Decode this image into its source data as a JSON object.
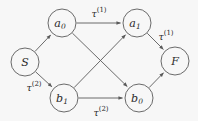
{
  "figure": {
    "kind": "directed-graph",
    "background_color": "#f7f7f7",
    "stroke_color": "#5a5a5a",
    "text_color": "#2b2b2b"
  },
  "nodes": [
    {
      "id": "S",
      "label": "S",
      "sub": "",
      "cx": 25,
      "cy": 62,
      "r": 14
    },
    {
      "id": "a0",
      "label": "a",
      "sub": "0",
      "cx": 62,
      "cy": 23,
      "r": 14
    },
    {
      "id": "a1",
      "label": "a",
      "sub": "1",
      "cx": 137,
      "cy": 23,
      "r": 14
    },
    {
      "id": "b1",
      "label": "b",
      "sub": "1",
      "cx": 64,
      "cy": 98,
      "r": 14
    },
    {
      "id": "b0",
      "label": "b",
      "sub": "0",
      "cx": 139,
      "cy": 98,
      "r": 14
    },
    {
      "id": "F",
      "label": "F",
      "sub": "",
      "cx": 175,
      "cy": 61,
      "r": 14
    }
  ],
  "edges": [
    {
      "id": "S-a0",
      "from": "S",
      "to": "a0",
      "label": "",
      "sup": ""
    },
    {
      "id": "S-b1",
      "from": "S",
      "to": "b1",
      "label": "τ",
      "sup": "(2)"
    },
    {
      "id": "a0-a1",
      "from": "a0",
      "to": "a1",
      "label": "τ",
      "sup": "(1)"
    },
    {
      "id": "a0-b0",
      "from": "a0",
      "to": "b0",
      "label": "",
      "sup": ""
    },
    {
      "id": "b1-a1",
      "from": "b1",
      "to": "a1",
      "label": "",
      "sup": ""
    },
    {
      "id": "b1-b0",
      "from": "b1",
      "to": "b0",
      "label": "τ",
      "sup": "(2)"
    },
    {
      "id": "a1-F",
      "from": "a1",
      "to": "F",
      "label": "τ",
      "sup": "(1)"
    },
    {
      "id": "b0-F",
      "from": "b0",
      "to": "F",
      "label": "",
      "sup": ""
    }
  ],
  "edge_labels": [
    {
      "id": "label-a0-a1",
      "text": "τ",
      "sup": "(1)",
      "x": 99,
      "y": 13
    },
    {
      "id": "label-a1-F",
      "text": "τ",
      "sup": "(1)",
      "x": 166,
      "y": 36
    },
    {
      "id": "label-S-b1",
      "text": "τ",
      "sup": "(2)",
      "x": 34,
      "y": 87
    },
    {
      "id": "label-b1-b0",
      "text": "τ",
      "sup": "(2)",
      "x": 101,
      "y": 112
    }
  ]
}
